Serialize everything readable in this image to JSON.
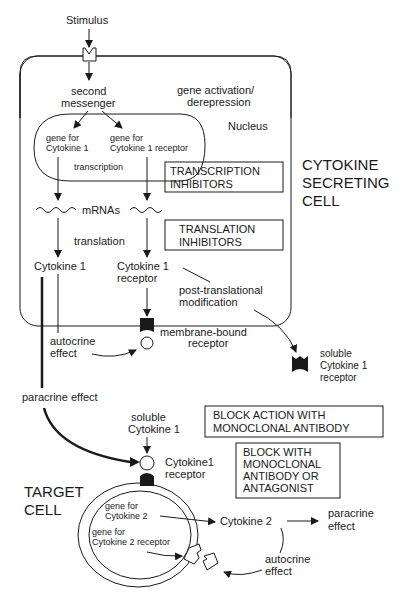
{
  "stimulus": "Stimulus",
  "secreting_cell": {
    "label_lines": [
      "CYTOKINE",
      "SECRETING",
      "CELL"
    ],
    "second_messenger": [
      "second",
      "messenger"
    ],
    "gene_activation": [
      "gene activation/",
      "derepression"
    ],
    "nucleus": "Nucleus",
    "gene_cytokine1": [
      "gene for",
      "Cytokine 1"
    ],
    "gene_cytokine1_receptor": [
      "gene for",
      "Cytokine 1 receptor"
    ],
    "transcription": "transcription",
    "transcription_inhibitors": [
      "TRANSCRIPTION",
      "INHIBITORS"
    ],
    "mrnas": "mRNAs",
    "translation": "translation",
    "translation_inhibitors": [
      "TRANSLATION",
      "INHIBITORS"
    ],
    "cytokine1": "Cytokine 1",
    "cytokine1_receptor": [
      "Cytokine 1",
      "receptor"
    ],
    "post_translational": [
      "post-translational",
      "modification"
    ],
    "autocrine_effect": [
      "autocrine",
      "effect"
    ],
    "membrane_bound": [
      "membrane-bound",
      "receptor"
    ]
  },
  "soluble_receptor": [
    "soluble",
    "Cytokine 1",
    "receptor"
  ],
  "paracrine_effect": "paracrine effect",
  "soluble_cytokine": [
    "soluble",
    "Cytokine 1"
  ],
  "block_action_box": [
    "BLOCK ACTION WITH",
    "MONOCLONAL ANTIBODY"
  ],
  "block_with_box": [
    "BLOCK WITH",
    "MONOCLONAL",
    "ANTIBODY OR",
    "ANTAGONIST"
  ],
  "target_cell": {
    "label_lines": [
      "TARGET",
      "CELL"
    ],
    "cytokine1_receptor": [
      "Cytokine1",
      "receptor"
    ],
    "gene_cytokine2": [
      "gene for",
      "Cytokine 2"
    ],
    "gene_cytokine2_receptor": [
      "gene for",
      "Cytokine 2 receptor"
    ],
    "cytokine2": "Cytokine 2",
    "paracrine_effect": [
      "paracrine",
      "effect"
    ],
    "autocrine_effect": [
      "autocrine",
      "effect"
    ]
  }
}
